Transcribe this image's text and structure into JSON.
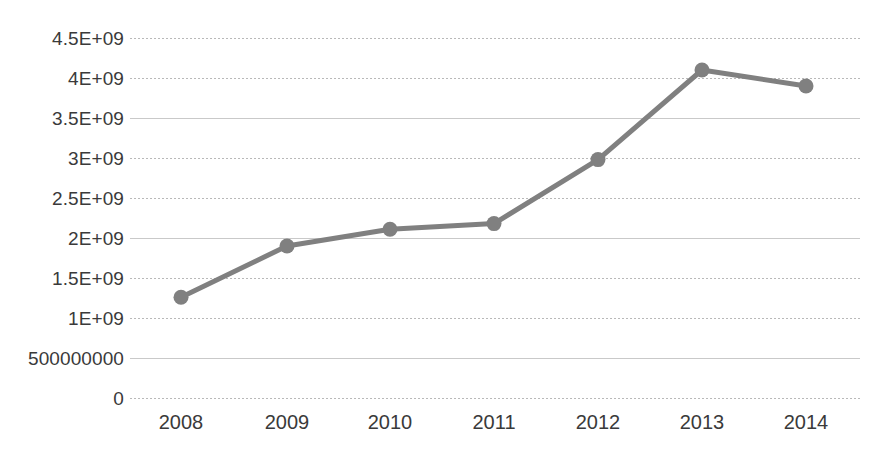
{
  "chart_data": {
    "type": "line",
    "title": "",
    "subtitle": "",
    "xlabel": "",
    "ylabel": "",
    "categories": [
      "2008",
      "2009",
      "2010",
      "2011",
      "2012",
      "2013",
      "2014"
    ],
    "series": [
      {
        "name": "Series 1",
        "values": [
          1260000000,
          1900000000,
          2110000000,
          2180000000,
          2980000000,
          4100000000,
          3900000000
        ],
        "color": "#808080",
        "marker": "circle"
      }
    ],
    "ylim": [
      0,
      4500000000
    ],
    "ytick_values": [
      0,
      500000000,
      1000000000,
      1500000000,
      2000000000,
      2500000000,
      3000000000,
      3500000000,
      4000000000,
      4500000000
    ],
    "ytick_labels": [
      "0",
      "500000000",
      "1E+09",
      "1.5E+09",
      "2E+09",
      "2.5E+09",
      "3E+09",
      "3.5E+09",
      "4E+09",
      "4.5E+09"
    ],
    "xtick_labels": [
      "2008",
      "2009",
      "2010",
      "2011",
      "2012",
      "2013",
      "2014"
    ],
    "grid": {
      "horizontal": true,
      "vertical": false,
      "style": "dotted",
      "color": "#b9b9b9"
    },
    "legend": {
      "visible": false,
      "position": "none",
      "entries": []
    },
    "annotations": [],
    "background_color": "#ffffff",
    "text_color": "#3a3a3a"
  }
}
